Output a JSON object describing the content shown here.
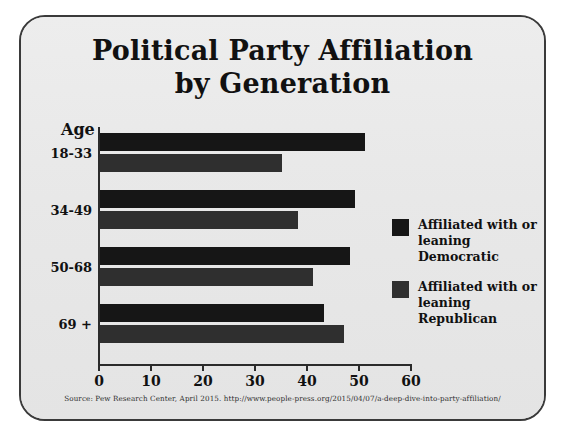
{
  "card": {
    "background_color": "#e9e9e9",
    "border_color": "#3a3a3a"
  },
  "title": {
    "line1": "Political Party Affiliation",
    "line2": "by Generation"
  },
  "axis": {
    "category_header": "Age",
    "tick_labels": [
      "0",
      "10",
      "20",
      "30",
      "40",
      "50",
      "60"
    ]
  },
  "legend": {
    "items": [
      {
        "label_line1": "Affiliated with or",
        "label_line2": "leaning Democratic",
        "color": "#161616"
      },
      {
        "label_line1": "Affiliated with or",
        "label_line2": "leaning Republican",
        "color": "#303030"
      }
    ]
  },
  "source": {
    "text": "Source: Pew Research Center, April 2015. http://www.people-press.org/2015/04/07/a-deep-dive-into-party-affiliation/"
  },
  "categories": [
    {
      "label": "18-33"
    },
    {
      "label": "34-49"
    },
    {
      "label": "50-68"
    },
    {
      "label": "69 +"
    }
  ],
  "chart_data": {
    "type": "bar",
    "orientation": "horizontal",
    "title": "Political Party Affiliation by Generation",
    "xlabel": "",
    "ylabel": "Age",
    "categories": [
      "18-33",
      "34-49",
      "50-68",
      "69 +"
    ],
    "series": [
      {
        "name": "Affiliated with or leaning Democratic",
        "color": "#161616",
        "values": [
          51,
          49,
          48,
          43
        ]
      },
      {
        "name": "Affiliated with or leaning Republican",
        "color": "#303030",
        "values": [
          35,
          38,
          41,
          47
        ]
      }
    ],
    "xlim": [
      0,
      60
    ],
    "xticks": [
      0,
      10,
      20,
      30,
      40,
      50,
      60
    ],
    "grid": false,
    "legend_position": "right",
    "annotation": "Source: Pew Research Center, April 2015. http://www.people-press.org/2015/04/07/a-deep-dive-into-party-affiliation/"
  }
}
